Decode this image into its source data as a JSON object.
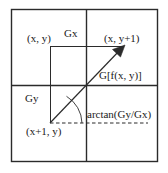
{
  "figure": {
    "type": "geometry-diagram",
    "width": 168,
    "height": 173,
    "colors": {
      "stroke": "#2b2b2b",
      "text": "#1a1a1a",
      "background": "#ffffff"
    },
    "labels": {
      "top_left_point": "(x, y)",
      "horizontal_component": "Gx",
      "top_right_point": "(x, y+1)",
      "gradient_magnitude": "G[f(x, y)]",
      "vertical_component": "Gy",
      "angle": "arctan(Gy/Gx)",
      "bottom_left_point": "(x+1, y)"
    },
    "geometry": {
      "outer_box": {
        "x": 11,
        "y": 9,
        "width": 147,
        "height": 153
      },
      "divider_vertical_x": 86,
      "divider_horizontal_y": 85,
      "inner_square": {
        "x": 50,
        "y": 46,
        "width": 74,
        "height": 77
      },
      "gradient_vector": {
        "from": [
          50,
          123
        ],
        "to": [
          124,
          46
        ]
      },
      "dashed_baseline": {
        "from": [
          50,
          123
        ],
        "to": [
          148,
          123
        ]
      },
      "angle_arc_radius": 32
    }
  }
}
